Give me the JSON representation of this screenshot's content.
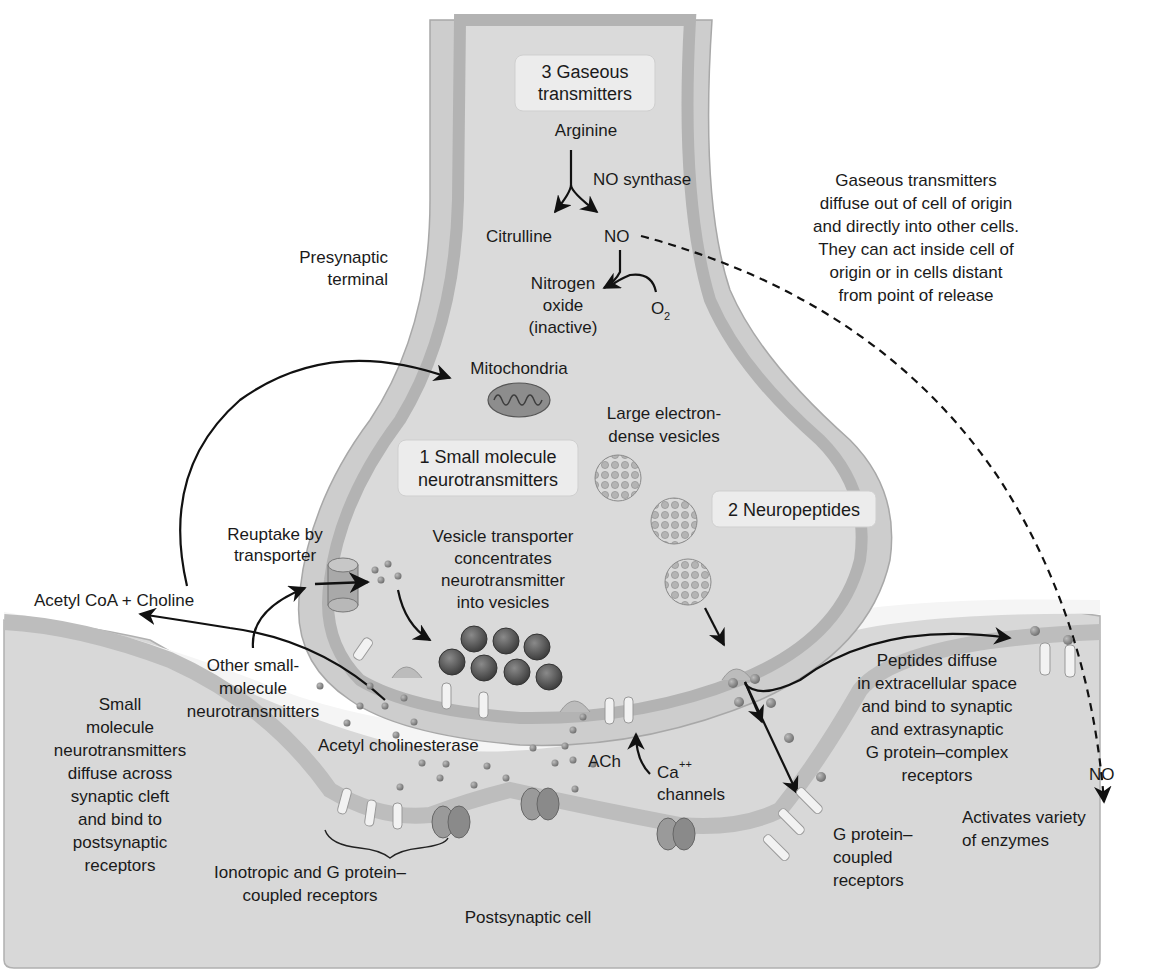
{
  "colors": {
    "background": "#ffffff",
    "cytoplasm": "#d9d9d9",
    "membrane_outer": "#cfcfcf",
    "membrane_band": "#b5b5b5",
    "postsynaptic_fill": "#d6d6d6",
    "cleft": "#f4f4f4",
    "label_box": "#ececec",
    "small_vesicle": "#5e5e5e",
    "large_vesicle": "#9a9a9a",
    "channel": "#8e8e8e",
    "receptor": "#f2f2f2",
    "arrow": "#111111"
  },
  "boxes": {
    "gaseous": [
      "3 Gaseous",
      "transmitters"
    ],
    "small_molecule": [
      "1 Small molecule",
      "neurotransmitters"
    ],
    "neuropeptides": [
      "2 Neuropeptides"
    ]
  },
  "labels": {
    "arginine": "Arginine",
    "no_synthase": "NO synthase",
    "citrulline": "Citrulline",
    "no_top": "NO",
    "nitrogen_oxide": [
      "Nitrogen",
      "oxide",
      "(inactive)"
    ],
    "o2": "O",
    "o2_sub": "2",
    "presynaptic_terminal": [
      "Presynaptic",
      "terminal"
    ],
    "mitochondria": "Mitochondria",
    "large_vesicles": [
      "Large electron-",
      "dense vesicles"
    ],
    "gaseous_note": [
      "Gaseous transmitters",
      "diffuse out of cell of origin",
      "and directly into other cells.",
      "They can act inside cell of",
      "origin or in cells distant",
      "from point of release"
    ],
    "reuptake": [
      "Reuptake by",
      "transporter"
    ],
    "vesicle_transporter": [
      "Vesicle transporter",
      "concentrates",
      "neurotransmitter",
      "into vesicles"
    ],
    "acetyl_coa": "Acetyl CoA + Choline",
    "other_small": [
      "Other small-",
      "molecule",
      "neurotransmitters"
    ],
    "small_diffuse": [
      "Small",
      "molecule",
      "neurotransmitters",
      "diffuse across",
      "synaptic cleft",
      "and bind to",
      "postsynaptic",
      "receptors"
    ],
    "acetyl_cholinesterase": "Acetyl cholinesterase",
    "ach": "ACh",
    "ca_channels": [
      "Ca",
      "++",
      "channels"
    ],
    "ionotropic": [
      "Ionotropic and G protein–",
      "coupled receptors"
    ],
    "postsynaptic_cell": "Postsynaptic cell",
    "peptides_diffuse": [
      "Peptides diffuse",
      "in extracellular space",
      "and bind to synaptic",
      "and extrasynaptic",
      "G protein–complex",
      "receptors"
    ],
    "no_bottom": "NO",
    "g_protein_coupled": [
      "G protein–",
      "coupled",
      "receptors"
    ],
    "activates_enzymes": [
      "Activates variety",
      "of enzymes"
    ]
  },
  "icons": [
    "mitochondrion-icon",
    "small-vesicle-icon",
    "large-dense-core-vesicle-icon",
    "reuptake-transporter-icon",
    "ion-channel-icon",
    "receptor-icon",
    "ca-channel-icon"
  ]
}
